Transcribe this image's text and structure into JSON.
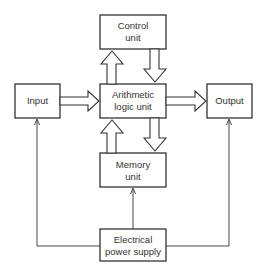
{
  "diagram": {
    "type": "block-diagram",
    "colors": {
      "stroke": "#333333",
      "background": "#ffffff",
      "text": "#333333"
    },
    "boxes": {
      "control": {
        "line1": "Control",
        "line2": "unit"
      },
      "input": {
        "line1": "Input"
      },
      "alu": {
        "line1": "Arithmetic",
        "line2": "logic unit"
      },
      "output": {
        "line1": "Output"
      },
      "memory": {
        "line1": "Memory",
        "line2": "unit"
      },
      "power": {
        "line1": "Electrical",
        "line2": "power supply"
      }
    },
    "connections": [
      {
        "from": "alu",
        "to": "control",
        "style": "hollow-arrow"
      },
      {
        "from": "control",
        "to": "alu",
        "style": "hollow-arrow"
      },
      {
        "from": "input",
        "to": "alu",
        "style": "hollow-arrow"
      },
      {
        "from": "alu",
        "to": "output",
        "style": "hollow-arrow"
      },
      {
        "from": "memory",
        "to": "alu",
        "style": "hollow-arrow"
      },
      {
        "from": "alu",
        "to": "memory",
        "style": "hollow-arrow"
      },
      {
        "from": "power",
        "to": "input",
        "style": "thin-line-arrow"
      },
      {
        "from": "power",
        "to": "output",
        "style": "thin-line-arrow"
      },
      {
        "from": "power",
        "to": "memory",
        "style": "thin-line-arrow"
      }
    ]
  }
}
